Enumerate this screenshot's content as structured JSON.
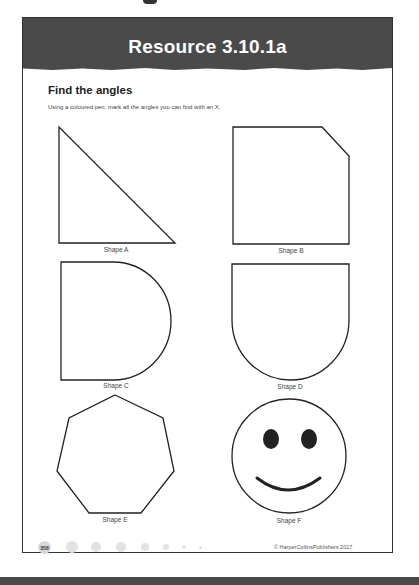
{
  "header": {
    "title": "Resource 3.10.1a"
  },
  "section": {
    "title": "Find the angles",
    "instruction": "Using a coloured pen, mark all the angles you can find with an X."
  },
  "shapes": [
    {
      "id": "A",
      "label": "Shape A",
      "description": "right-angled triangle"
    },
    {
      "id": "B",
      "label": "Shape B",
      "description": "square with one corner cut off (pentagon)"
    },
    {
      "id": "C",
      "label": "Shape C",
      "description": "D shape, straight left side with semicircle on right"
    },
    {
      "id": "D",
      "label": "Shape D",
      "description": "U shape, straight top with semicircle at bottom"
    },
    {
      "id": "E",
      "label": "Shape E",
      "description": "heptagon"
    },
    {
      "id": "F",
      "label": "Shape F",
      "description": "smiley face circle"
    }
  ],
  "footer": {
    "page_number": "358",
    "copyright": "© HarperCollinsPublishers 2017"
  },
  "colors": {
    "header_bg": "#4a4a4a",
    "header_text": "#ffffff",
    "stroke": "#222222"
  }
}
